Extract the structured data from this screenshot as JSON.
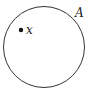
{
  "diagram": {
    "type": "set-membership",
    "set": {
      "label": "A",
      "shape": "circle",
      "stroke": "#333333"
    },
    "element": {
      "label": "x",
      "marker": "filled-dot",
      "color": "#111111"
    }
  }
}
